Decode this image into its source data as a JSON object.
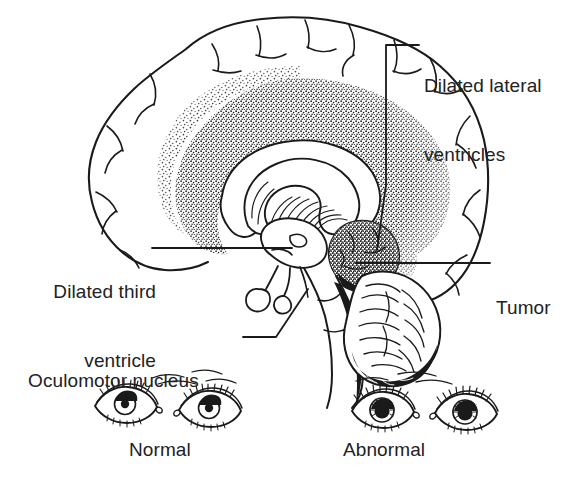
{
  "figure": {
    "background_color": "#ffffff",
    "ink_color": "#1a1a1a",
    "text_color": "#222222"
  },
  "annotations": [
    {
      "id": "dilated-lateral-ventricles",
      "text": "Dilated lateral\nventricles",
      "line1": "Dilated lateral",
      "line2": "ventricles",
      "leader": "elbow-down-left"
    },
    {
      "id": "dilated-third-ventricle",
      "text": "Dilated third\nventricle",
      "line1": "Dilated third",
      "line2": "ventricle",
      "leader": "horizontal-right"
    },
    {
      "id": "oculomotor-nucleus",
      "text": "Oculomotor nucleus",
      "line1": "Oculomotor nucleus",
      "line2": "",
      "leader": "elbow-up-right"
    },
    {
      "id": "tumor",
      "text": "Tumor",
      "line1": "Tumor",
      "line2": "",
      "leader": "horizontal-left"
    }
  ],
  "captions": {
    "normal": "Normal",
    "abnormal": "Abnormal"
  },
  "structures": [
    {
      "name": "cerebral-cortex",
      "style": "outline-gyri"
    },
    {
      "name": "white-matter-stipple",
      "style": "stipple"
    },
    {
      "name": "lateral-ventricle",
      "style": "clear-crescent"
    },
    {
      "name": "corpus-callosum",
      "style": "hatched-arc"
    },
    {
      "name": "third-ventricle",
      "style": "clear-cavity"
    },
    {
      "name": "tumor-mass",
      "style": "dense-stipple"
    },
    {
      "name": "cerebellum",
      "style": "arbor-vitae-foliation"
    },
    {
      "name": "brainstem",
      "style": "outline"
    },
    {
      "name": "pituitary",
      "style": "outline-lobe"
    }
  ],
  "eyes": {
    "normal": {
      "side": "left",
      "pupil": "constricted",
      "count": 2
    },
    "abnormal": {
      "side": "right",
      "pupil": "dilated",
      "count": 2
    }
  }
}
